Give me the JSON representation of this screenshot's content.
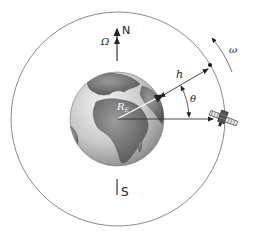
{
  "diagram": {
    "labels": {
      "north": "N",
      "south": "S",
      "earth_rotation": "Ω",
      "orbital_rate": "ω",
      "altitude": "h",
      "earth_radius": "R",
      "earth_radius_subscript": "E",
      "angle": "θ"
    },
    "colors": {
      "line": "#333333",
      "orbit": "#888888",
      "earth_ocean": "#d6d6d6",
      "earth_land": "#7a7a7a",
      "background": "#ffffff"
    }
  }
}
